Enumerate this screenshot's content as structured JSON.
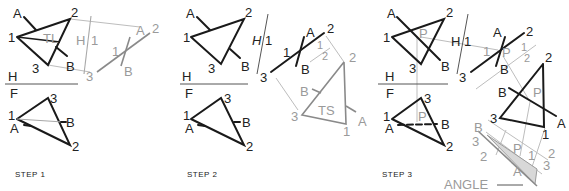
{
  "figure": {
    "steps": [
      {
        "label": "STEP 1"
      },
      {
        "label": "STEP 2"
      },
      {
        "label": "STEP 3"
      }
    ],
    "reference_plane_labels": {
      "top": "H",
      "bottom": "F",
      "aux1": "H",
      "aux1b": "1",
      "aux2a": "1",
      "aux2b": "2"
    },
    "point_labels": {
      "A": "A",
      "B": "B",
      "P": "P",
      "p1": "1",
      "p2": "2",
      "p3": "3"
    },
    "annotations": {
      "true_length": "TL",
      "true_shape": "TS",
      "angle": "ANGLE"
    },
    "colors": {
      "object": "#1a1a1a",
      "projection": "#bdbdbd",
      "auxiliary": "#8a8a8a",
      "angle_fill": "#d8d8d8"
    }
  }
}
